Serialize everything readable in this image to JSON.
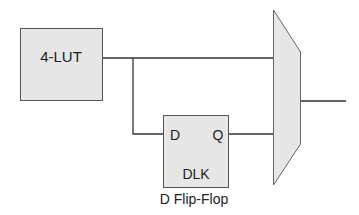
{
  "diagram": {
    "lut": {
      "label": "4-LUT"
    },
    "dff": {
      "d_port": "D",
      "q_port": "Q",
      "clk_label": "DLK",
      "caption": "D Flip-Flop"
    },
    "mux": {
      "label": ""
    }
  },
  "colors": {
    "fill": "#e6e6e6",
    "stroke": "#555555",
    "wire": "#333333",
    "text": "#222222"
  }
}
